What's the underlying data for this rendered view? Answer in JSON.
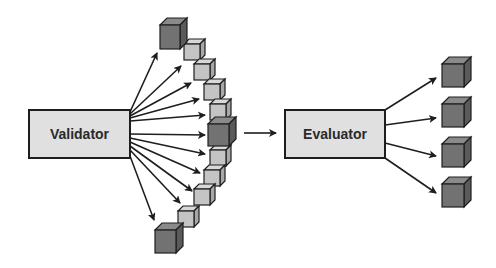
{
  "diagram": {
    "nodes": {
      "validator": {
        "label": "Validator"
      },
      "evaluator": {
        "label": "Evaluator"
      }
    },
    "colors": {
      "box_fill": "#e0e0e0",
      "stroke": "#1e1e1e",
      "cube_dark_front": "#727272",
      "cube_dark_top": "#8a8a8a",
      "cube_dark_side": "#5a5a5a",
      "cube_light_front": "#c4c4c4",
      "cube_light_top": "#d8d8d8",
      "cube_light_side": "#a8a8a8"
    },
    "validator_outputs": {
      "count": 12,
      "description": "Arc of candidate cubes; three dark (top, middle, bottom) and light cubes in between"
    },
    "evaluator_outputs": {
      "count": 4,
      "description": "Four dark cubes selected by evaluator"
    },
    "connector": {
      "from": "validator-arc",
      "to": "evaluator"
    }
  }
}
